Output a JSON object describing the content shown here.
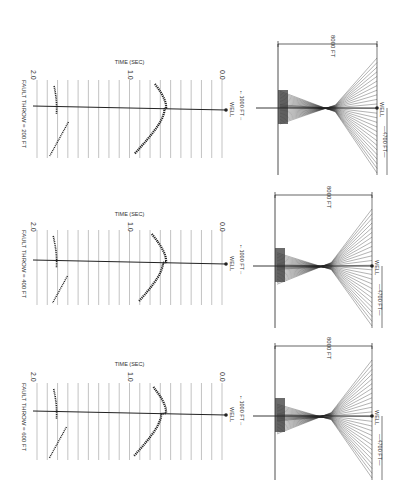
{
  "figure": {
    "orientation": "rotated-90-clockwise",
    "panels": [
      {
        "id": "throw-200",
        "fault_throw_label": "FAULT THROW = 200 FT",
        "time_axis_label": "TIME (SEC)",
        "time_ticks": [
          "2.0",
          "1.0",
          "0.0"
        ],
        "well_label": "WELL",
        "offset_label": "←1000 FT→",
        "ray_width_label": "8000 FT",
        "ray_well_label": "WELL",
        "ray_offset_label": "—4700 FT—"
      },
      {
        "id": "throw-400",
        "fault_throw_label": "FAULT THROW = 400 FT",
        "time_axis_label": "TIME (SEC)",
        "time_ticks": [
          "2.0",
          "1.0",
          "0.0"
        ],
        "well_label": "WELL",
        "offset_label": "←1000 FT→",
        "ray_width_label": "8000 FT",
        "ray_well_label": "WELL",
        "ray_offset_label": "—4700 FT—"
      },
      {
        "id": "throw-600",
        "fault_throw_label": "FAULT THROW = 600 FT",
        "time_axis_label": "TIME (SEC)",
        "time_ticks": [
          "2.0",
          "1.0",
          "0.0"
        ],
        "well_label": "WELL",
        "offset_label": "←1000 FT→",
        "ray_width_label": "8000 FT",
        "ray_well_label": "WELL",
        "ray_offset_label": "—4700 FT—"
      }
    ]
  },
  "colors": {
    "ink": "#222222",
    "grid": "#9a9a9a",
    "background": "#ffffff"
  }
}
